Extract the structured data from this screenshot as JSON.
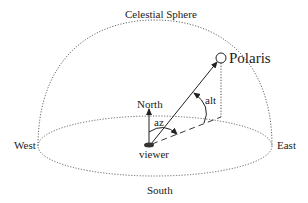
{
  "title": "Celestial Sphere",
  "labels": {
    "celestial_sphere": "Celestial Sphere",
    "polaris": "Polaris",
    "north": "North",
    "south": "South",
    "east": "East",
    "west": "West",
    "viewer": "viewer",
    "altitude": "alt",
    "azimuth": "az"
  },
  "colors": {
    "line": "#222222",
    "dotted": "#555555",
    "background": "#ffffff"
  }
}
